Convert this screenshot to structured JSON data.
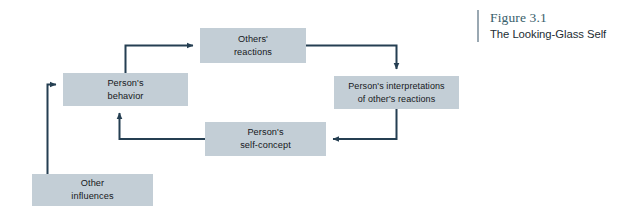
{
  "caption": {
    "figure_number": "Figure 3.1",
    "figure_title": "The Looking-Glass Self"
  },
  "diagram": {
    "title": "The Looking-Glass Self",
    "type": "cyclical-flowchart",
    "box_fill_color": "#c3ced6",
    "connector_color": "#253f52",
    "background_color": "#ffffff",
    "nodes": [
      {
        "id": "others-reactions",
        "label": "Others'\nreactions"
      },
      {
        "id": "persons-behavior",
        "label": "Person's\nbehavior"
      },
      {
        "id": "persons-interpretations",
        "label": "Person's interpretations\nof other's reactions"
      },
      {
        "id": "persons-self-concept",
        "label": "Person's\nself-concept"
      },
      {
        "id": "other-influences",
        "label": "Other\ninfluences"
      }
    ],
    "connectors": [
      {
        "id": "behavior-to-reactions",
        "from": "persons-behavior",
        "to": "others-reactions"
      },
      {
        "id": "reactions-to-interpretations",
        "from": "others-reactions",
        "to": "persons-interpretations"
      },
      {
        "id": "interpretations-to-self-concept",
        "from": "persons-interpretations",
        "to": "persons-self-concept"
      },
      {
        "id": "self-concept-to-behavior",
        "from": "persons-self-concept",
        "to": "persons-behavior"
      },
      {
        "id": "other-influences-to-behavior",
        "from": "other-influences",
        "to": "persons-behavior"
      }
    ]
  }
}
